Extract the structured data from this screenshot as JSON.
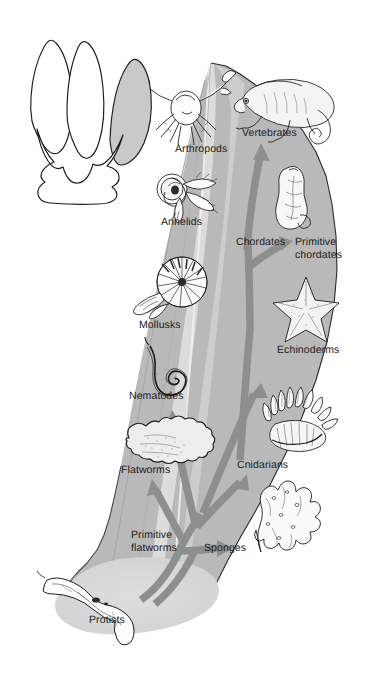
{
  "figure": {
    "background_color": "#ffffff",
    "canopy_fill": "#b9b9b9",
    "canopy_light_fill": "#d4d4d4",
    "protist_blob_fill": "#d8d8d8",
    "arrow_fill": "#8e8e8e",
    "outline_color": "#1b1b1b",
    "label_color": "#1b1b1b"
  },
  "legend_shape": {
    "name": "three-lobed-crown-outline",
    "lobes": 3,
    "shaded_lobe_index": 3,
    "shaded_fill": "#c9c9c9",
    "stroke": "#1b1b1b"
  },
  "labels": [
    {
      "id": "arthropods",
      "text": "Arthropods",
      "x": 175,
      "y": 143,
      "align": "left"
    },
    {
      "id": "vertebrates",
      "text": "Vertebrates",
      "x": 242,
      "y": 127,
      "align": "left"
    },
    {
      "id": "annelids",
      "text": "Annelids",
      "x": 161,
      "y": 216,
      "align": "left"
    },
    {
      "id": "chordates",
      "text": "Chordates",
      "x": 236,
      "y": 236,
      "align": "left"
    },
    {
      "id": "primitive-chordates",
      "text": "Primitive\nchordates",
      "x": 295,
      "y": 236,
      "align": "left"
    },
    {
      "id": "mollusks",
      "text": "Mollusks",
      "x": 139,
      "y": 319,
      "align": "left"
    },
    {
      "id": "echinoderms",
      "text": "Echinoderms",
      "x": 277,
      "y": 344,
      "align": "left"
    },
    {
      "id": "nematodes",
      "text": "Nematodes",
      "x": 129,
      "y": 390,
      "align": "left"
    },
    {
      "id": "flatworms",
      "text": "Flatworms",
      "x": 121,
      "y": 464,
      "align": "left"
    },
    {
      "id": "cnidarians",
      "text": "Cnidarians",
      "x": 237,
      "y": 459,
      "align": "left"
    },
    {
      "id": "primitive-flatworms",
      "text": "Primitive\nflatworms",
      "x": 131,
      "y": 529,
      "align": "left"
    },
    {
      "id": "sponges",
      "text": "Sponges",
      "x": 204,
      "y": 542,
      "align": "left"
    },
    {
      "id": "protists",
      "text": "Protists",
      "x": 89,
      "y": 614,
      "align": "left"
    }
  ],
  "organisms": [
    {
      "id": "crab",
      "label": "Arthropods",
      "drawing": "crab-illustration",
      "cx": 186,
      "cy": 108
    },
    {
      "id": "chameleon",
      "label": "Vertebrates",
      "drawing": "chameleon-illustration",
      "cx": 297,
      "cy": 100
    },
    {
      "id": "polychaete",
      "label": "Annelids",
      "drawing": "annelid-worm-illustration",
      "cx": 185,
      "cy": 190
    },
    {
      "id": "tunicate",
      "label": "Primitive chordates",
      "drawing": "tunicate-illustration",
      "cx": 293,
      "cy": 198
    },
    {
      "id": "nautilus",
      "label": "Mollusks",
      "drawing": "nautilus-illustration",
      "cx": 175,
      "cy": 283
    },
    {
      "id": "seastar",
      "label": "Echinoderms",
      "drawing": "sea-star-illustration",
      "cx": 305,
      "cy": 306
    },
    {
      "id": "roundworm",
      "label": "Nematodes",
      "drawing": "nematode-illustration",
      "cx": 163,
      "cy": 366
    },
    {
      "id": "seaanemone",
      "label": "Cnidarians",
      "drawing": "sea-anemone-illustration",
      "cx": 289,
      "cy": 428
    },
    {
      "id": "planarian",
      "label": "Flatworms",
      "drawing": "flatworm-illustration",
      "cx": 164,
      "cy": 440
    },
    {
      "id": "sponge",
      "label": "Sponges",
      "drawing": "sponge-illustration",
      "cx": 281,
      "cy": 514
    },
    {
      "id": "euglena",
      "label": "Protists",
      "drawing": "protist-illustration",
      "cx": 110,
      "cy": 591
    }
  ],
  "branches": [
    {
      "from": "Protists",
      "to": "Primitive flatworms"
    },
    {
      "from": "Primitive flatworms",
      "to": "Sponges"
    },
    {
      "from": "Primitive flatworms",
      "to": "Cnidarians"
    },
    {
      "from": "Primitive flatworms",
      "to": "Flatworms"
    },
    {
      "from": "Primitive flatworms",
      "to": "Nematodes"
    },
    {
      "from": "Primitive flatworms",
      "to": "Echinoderms"
    },
    {
      "from": "Echinoderms",
      "to": "Chordates"
    },
    {
      "from": "Chordates",
      "to": "Primitive chordates"
    },
    {
      "from": "Chordates",
      "to": "Vertebrates"
    }
  ]
}
